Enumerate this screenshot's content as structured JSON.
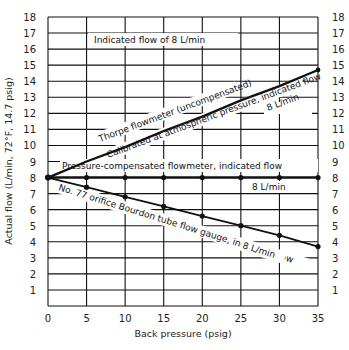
{
  "chart_data": {
    "type": "line",
    "title": "",
    "xlabel": "Back pressure (psig)",
    "ylabel": "Actual flow (L/min, 72°F, 14.7 psig)",
    "xlim": [
      0,
      35
    ],
    "ylim": [
      0,
      18
    ],
    "x_ticks": [
      "0",
      "5",
      "10",
      "15",
      "20",
      "25",
      "30",
      "35"
    ],
    "y_ticks": [
      "1",
      "2",
      "3",
      "4",
      "5",
      "6",
      "7",
      "8",
      "9",
      "10",
      "11",
      "12",
      "13",
      "14",
      "15",
      "16",
      "17",
      "18"
    ],
    "grid": true,
    "y_ticks_on_both_sides": true,
    "x": [
      0,
      5,
      10,
      15,
      20,
      25,
      30,
      35
    ],
    "series": [
      {
        "name": "Thorpe flowmeter (uncompensated) Calibrated at atmospheric pressure, indicated flow 8 L/min",
        "values": [
          8.0,
          9.0,
          9.9,
          10.9,
          11.8,
          12.8,
          13.7,
          14.7
        ],
        "markers": false
      },
      {
        "name": "Pressure-compensated flowmeter, indicated flow 8 L/min",
        "values": [
          8.0,
          8.0,
          8.0,
          8.0,
          8.0,
          8.0,
          8.0,
          8.0
        ],
        "markers": true
      },
      {
        "name": "No. 77 orifice Bourdon tube flow gauge, indicated flow 8 L/min",
        "values": [
          8.0,
          7.4,
          6.8,
          6.2,
          5.6,
          5.0,
          4.4,
          3.7
        ],
        "markers": true
      }
    ],
    "annotations": [
      "Indicated flow of 8 L/min",
      "Thorpe flowmeter (uncompensated)",
      "Calibrated at atmospheric pressure, indicated flow",
      "8 L/min",
      "Pressure-compensated flowmeter, indicated flow",
      "8 L/min",
      "No. 77 orifice Bourdon tube flow gauge, indicated flow",
      "8 L/min"
    ]
  },
  "labels": {
    "header_note": "Indicated flow of 8 L/min",
    "thorpe_top": "Thorpe flowmeter (uncompensated)",
    "thorpe_bottom": "Calibrated at atmospheric pressure, indicated flow",
    "thorpe_value": "8  L/min",
    "compensated_top": "Pressure-compensated flowmeter, indicated flow",
    "compensated_value": "8  L/min",
    "orifice_top": "No. 77 orifice Bourdon tube flow gauge, indicated flow",
    "orifice_value": "8 L/min"
  }
}
